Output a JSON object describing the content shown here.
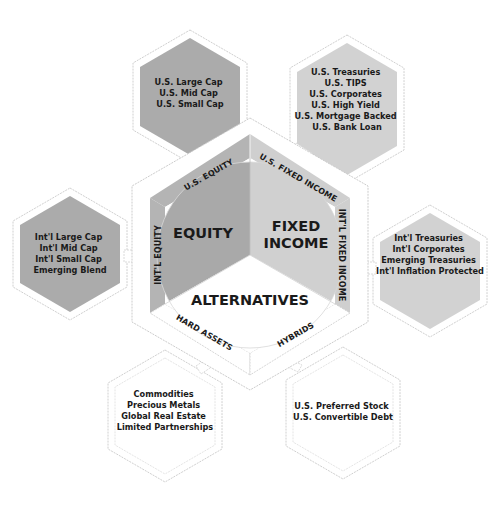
{
  "diagram": {
    "core": {
      "equity": "EQUITY",
      "fixed_income_line1": "FIXED",
      "fixed_income_line2": "INCOME",
      "alternatives": "ALTERNATIVES"
    },
    "bands": {
      "us_equity": "U.S. EQUITY",
      "us_fixed_income": "U.S. FIXED INCOME",
      "intl_equity": "INT'L EQUITY",
      "intl_fixed_income": "INT'L FIXED INCOME",
      "hard_assets": "HARD ASSETS",
      "hybrids": "HYBRIDS"
    },
    "satellites": {
      "us_equity": [
        "U.S. Large Cap",
        "U.S. Mid Cap",
        "U.S. Small Cap"
      ],
      "us_fixed_income": [
        "U.S. Treasuries",
        "U.S. TIPS",
        "U.S. Corporates",
        "U.S. High Yield",
        "U.S. Mortgage Backed",
        "U.S. Bank Loan"
      ],
      "intl_equity": [
        "Int'l Large Cap",
        "Int'l Mid Cap",
        "Int'l Small Cap",
        "Emerging Blend"
      ],
      "intl_fixed_income": [
        "Int'l Treasuries",
        "Int'l Corporates",
        "Emerging Treasuries",
        "Int'l Inflation Protected"
      ],
      "hard_assets": [
        "Commodities",
        "Precious Metals",
        "Global Real Estate",
        "Limited Partnerships"
      ],
      "hybrids": [
        "U.S. Preferred Stock",
        "U.S. Convertible Debt"
      ]
    },
    "colors": {
      "equity_dark": "#a9a9a9",
      "equity_band": "#b4b4b4",
      "fixed_light": "#cfcfcf",
      "fixed_band": "#c8c8c8",
      "alternatives": "#ffffff",
      "outline": "#c8c8c8",
      "text": "#1a1a1a"
    }
  }
}
